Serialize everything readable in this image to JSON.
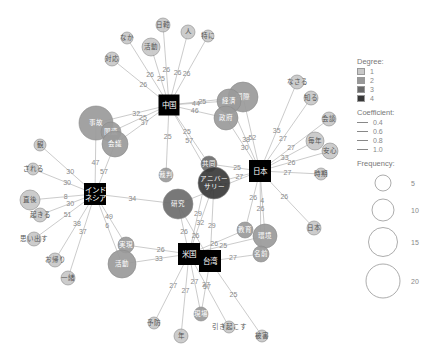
{
  "legend": {
    "degree_title": "Degree:",
    "degree_items": [
      {
        "label": "1",
        "color": "#c8c8c8"
      },
      {
        "label": "2",
        "color": "#999999"
      },
      {
        "label": "3",
        "color": "#6a6a6a"
      },
      {
        "label": "4",
        "color": "#383838"
      }
    ],
    "coefficient_title": "Coefficient:",
    "coefficient_items": [
      {
        "label": "0.4",
        "width": 0.5
      },
      {
        "label": "0.6",
        "width": 0.9
      },
      {
        "label": "0.8",
        "width": 1.3
      },
      {
        "label": "1.0",
        "width": 1.7
      }
    ],
    "frequency_title": "Frequency:",
    "frequency_items": [
      {
        "label": "5",
        "r": 12
      },
      {
        "label": "10",
        "r": 17
      },
      {
        "label": "15",
        "r": 22
      },
      {
        "label": "20",
        "r": 25
      }
    ]
  },
  "hubs": [
    {
      "id": "china",
      "label": "中国",
      "x": 169,
      "y": 105,
      "w": 21,
      "h": 21
    },
    {
      "id": "japan",
      "label": "日本",
      "x": 260,
      "y": 171,
      "w": 22,
      "h": 22
    },
    {
      "id": "indonesia",
      "label": "インド\nネシア",
      "x": 95,
      "y": 194,
      "w": 22,
      "h": 22
    },
    {
      "id": "usa",
      "label": "米国",
      "x": 189,
      "y": 254,
      "w": 22,
      "h": 22
    },
    {
      "id": "taiwan",
      "label": "台湾",
      "x": 210,
      "y": 261,
      "w": 22,
      "h": 22
    }
  ],
  "nodes": [
    {
      "id": "n_nichibei",
      "label": "日韓",
      "x": 163,
      "y": 25,
      "r": 7,
      "degree": 1
    },
    {
      "id": "n_jin",
      "label": "人",
      "x": 188,
      "y": 32,
      "r": 7,
      "degree": 1
    },
    {
      "id": "n_tokai",
      "label": "特に",
      "x": 208,
      "y": 36,
      "r": 6,
      "degree": 1
    },
    {
      "id": "n_nakaha",
      "label": "なか",
      "x": 127,
      "y": 38,
      "r": 6,
      "degree": 1
    },
    {
      "id": "n_katsudo",
      "label": "活動",
      "x": 151,
      "y": 47,
      "r": 9,
      "degree": 1
    },
    {
      "id": "n_taio",
      "label": "対応",
      "x": 112,
      "y": 59,
      "r": 7,
      "degree": 1
    },
    {
      "id": "n_kokusai",
      "label": "国際",
      "x": 243,
      "y": 97,
      "r": 15,
      "degree": 2
    },
    {
      "id": "n_keizai",
      "label": "経済",
      "x": 229,
      "y": 101,
      "r": 12,
      "degree": 2
    },
    {
      "id": "n_seifu",
      "label": "政府",
      "x": 226,
      "y": 118,
      "r": 12,
      "degree": 2
    },
    {
      "id": "n_jiko",
      "label": "事故",
      "x": 96,
      "y": 123,
      "r": 17,
      "degree": 2
    },
    {
      "id": "n_kanren",
      "label": "関連",
      "x": 111,
      "y": 132,
      "r": 10,
      "degree": 2
    },
    {
      "id": "n_kaigi",
      "label": "会議",
      "x": 115,
      "y": 144,
      "r": 13,
      "degree": 2
    },
    {
      "id": "n_saiban",
      "label": "裁判",
      "x": 166,
      "y": 175,
      "r": 7,
      "degree": 2
    },
    {
      "id": "n_kyoudo",
      "label": "共同",
      "x": 209,
      "y": 164,
      "r": 8,
      "degree": 3
    },
    {
      "id": "n_anniv",
      "label": "アニバー\nサリー",
      "x": 214,
      "y": 183,
      "r": 16,
      "degree": 4
    },
    {
      "id": "n_kenkyu",
      "label": "研究",
      "x": 178,
      "y": 204,
      "r": 15,
      "degree": 3
    },
    {
      "id": "n_nakasu",
      "label": "なさる",
      "x": 297,
      "y": 82,
      "r": 7,
      "degree": 1
    },
    {
      "id": "n_chishiki",
      "label": "知る",
      "x": 311,
      "y": 98,
      "r": 7,
      "degree": 1
    },
    {
      "id": "n_kaiken",
      "label": "会談",
      "x": 329,
      "y": 119,
      "r": 7,
      "degree": 1
    },
    {
      "id": "n_mainen",
      "label": "毎年",
      "x": 315,
      "y": 141,
      "r": 9,
      "degree": 1
    },
    {
      "id": "n_anzen",
      "label": "安心",
      "x": 330,
      "y": 151,
      "r": 8,
      "degree": 1
    },
    {
      "id": "n_jikan",
      "label": "時期",
      "x": 321,
      "y": 174,
      "r": 6,
      "degree": 1
    },
    {
      "id": "n_nihon",
      "label": "日本",
      "x": 314,
      "y": 228,
      "r": 7,
      "degree": 1
    },
    {
      "id": "n_kyoiku",
      "label": "教育",
      "x": 245,
      "y": 230,
      "r": 8,
      "degree": 2
    },
    {
      "id": "n_kankyo",
      "label": "環境",
      "x": 265,
      "y": 236,
      "r": 12,
      "degree": 2
    },
    {
      "id": "n_kokoro",
      "label": "名前",
      "x": 261,
      "y": 254,
      "r": 8,
      "degree": 2
    },
    {
      "id": "n_ryo",
      "label": "観",
      "x": 40,
      "y": 145,
      "r": 6,
      "degree": 1
    },
    {
      "id": "n_sareru",
      "label": "される",
      "x": 33,
      "y": 169,
      "r": 6,
      "degree": 1
    },
    {
      "id": "n_ima",
      "label": "直後",
      "x": 30,
      "y": 200,
      "r": 10,
      "degree": 1
    },
    {
      "id": "n_okiru",
      "label": "起きる",
      "x": 40,
      "y": 215,
      "r": 7,
      "degree": 1
    },
    {
      "id": "n_omoidasu",
      "label": "思い出す",
      "x": 34,
      "y": 239,
      "r": 7,
      "degree": 1
    },
    {
      "id": "n_okaeri",
      "label": "お帰り",
      "x": 55,
      "y": 260,
      "r": 7,
      "degree": 1
    },
    {
      "id": "n_ichiban",
      "label": "一緒",
      "x": 68,
      "y": 278,
      "r": 7,
      "degree": 1
    },
    {
      "id": "n_oyaji",
      "label": "実現",
      "x": 126,
      "y": 245,
      "r": 8,
      "degree": 2
    },
    {
      "id": "n_kazoku",
      "label": "活動",
      "x": 122,
      "y": 264,
      "r": 14,
      "degree": 2
    },
    {
      "id": "n_yobou",
      "label": "予防",
      "x": 154,
      "y": 323,
      "r": 6,
      "degree": 1
    },
    {
      "id": "n_nen",
      "label": "年",
      "x": 181,
      "y": 336,
      "r": 7,
      "degree": 1
    },
    {
      "id": "n_genba",
      "label": "現場",
      "x": 201,
      "y": 314,
      "r": 7,
      "degree": 2
    },
    {
      "id": "n_hikiokosu",
      "label": "引き起こす",
      "x": 229,
      "y": 327,
      "r": 6,
      "degree": 1
    },
    {
      "id": "n_higai",
      "label": "被害",
      "x": 262,
      "y": 336,
      "r": 6,
      "degree": 1
    }
  ],
  "edges": [
    {
      "from": "china",
      "to": "n_nichibei",
      "label": "26"
    },
    {
      "from": "china",
      "to": "n_jin",
      "label": "26"
    },
    {
      "from": "china",
      "to": "n_tokai",
      "label": "26"
    },
    {
      "from": "china",
      "to": "n_nakaha",
      "label": "26"
    },
    {
      "from": "china",
      "to": "n_katsudo",
      "label": "25"
    },
    {
      "from": "china",
      "to": "n_taio",
      "label": "26"
    },
    {
      "from": "china",
      "to": "n_keizai",
      "label": "44"
    },
    {
      "from": "china",
      "to": "n_kokusai",
      "label": "25"
    },
    {
      "from": "china",
      "to": "n_seifu",
      "label": "46"
    },
    {
      "from": "china",
      "to": "n_jiko",
      "label": "32"
    },
    {
      "from": "china",
      "to": "n_kanren",
      "label": "25"
    },
    {
      "from": "china",
      "to": "n_kaigi",
      "label": "37"
    },
    {
      "from": "china",
      "to": "n_saiban",
      "label": "25"
    },
    {
      "from": "china",
      "to": "n_kyoudo",
      "label": "25"
    },
    {
      "from": "china",
      "to": "n_anniv",
      "label": "57"
    },
    {
      "from": "japan",
      "to": "n_kokusai",
      "label": "52"
    },
    {
      "from": "japan",
      "to": "n_seifu",
      "label": "30"
    },
    {
      "from": "japan",
      "to": "n_keizai",
      "label": "38"
    },
    {
      "from": "japan",
      "to": "n_nakasu",
      "label": "35"
    },
    {
      "from": "japan",
      "to": "n_chishiki",
      "label": "27"
    },
    {
      "from": "japan",
      "to": "n_kaiken",
      "label": "27"
    },
    {
      "from": "japan",
      "to": "n_mainen",
      "label": "33"
    },
    {
      "from": "japan",
      "to": "n_anzen",
      "label": "26"
    },
    {
      "from": "japan",
      "to": "n_jikan",
      "label": "27"
    },
    {
      "from": "japan",
      "to": "n_nihon",
      "label": "26"
    },
    {
      "from": "japan",
      "to": "n_kyoudo",
      "label": "25"
    },
    {
      "from": "japan",
      "to": "n_anniv",
      "label": "27"
    },
    {
      "from": "japan",
      "to": "n_kenkyu",
      "label": "57"
    },
    {
      "from": "japan",
      "to": "n_kyoiku",
      "label": "26"
    },
    {
      "from": "japan",
      "to": "n_kankyo",
      "label": "4"
    },
    {
      "from": "japan",
      "to": "n_kokoro",
      "label": "26"
    },
    {
      "from": "indonesia",
      "to": "n_jiko",
      "label": "47"
    },
    {
      "from": "indonesia",
      "to": "n_kaigi",
      "label": "57"
    },
    {
      "from": "indonesia",
      "to": "n_ryo",
      "label": "30"
    },
    {
      "from": "indonesia",
      "to": "n_sareru",
      "label": "30"
    },
    {
      "from": "indonesia",
      "to": "n_ima",
      "label": "8"
    },
    {
      "from": "indonesia",
      "to": "n_okiru",
      "label": "30"
    },
    {
      "from": "indonesia",
      "to": "n_omoidasu",
      "label": "51"
    },
    {
      "from": "indonesia",
      "to": "n_okaeri",
      "label": "38"
    },
    {
      "from": "indonesia",
      "to": "n_ichiban",
      "label": "37"
    },
    {
      "from": "indonesia",
      "to": "n_kenkyu",
      "label": "34"
    },
    {
      "from": "indonesia",
      "to": "n_oyaji",
      "label": "49"
    },
    {
      "from": "indonesia",
      "to": "n_kazoku",
      "label": "6"
    },
    {
      "from": "usa",
      "to": "n_kenkyu",
      "label": "26"
    },
    {
      "from": "usa",
      "to": "n_anniv",
      "label": "32"
    },
    {
      "from": "usa",
      "to": "n_kyoudo",
      "label": "29"
    },
    {
      "from": "usa",
      "to": "n_oyaji",
      "label": "26"
    },
    {
      "from": "usa",
      "to": "n_kazoku",
      "label": "33"
    },
    {
      "from": "usa",
      "to": "n_kyoiku",
      "label": "26"
    },
    {
      "from": "usa",
      "to": "n_kankyo",
      "label": "25"
    },
    {
      "from": "usa",
      "to": "n_yobou",
      "label": "27"
    },
    {
      "from": "usa",
      "to": "n_nen",
      "label": "27"
    },
    {
      "from": "usa",
      "to": "n_genba",
      "label": "27"
    },
    {
      "from": "usa",
      "to": "n_hikiokosu",
      "label": "57"
    },
    {
      "from": "taiwan",
      "to": "n_kenkyu",
      "label": "26"
    },
    {
      "from": "taiwan",
      "to": "n_anniv",
      "label": "29"
    },
    {
      "from": "taiwan",
      "to": "n_kokoro",
      "label": "27"
    },
    {
      "from": "taiwan",
      "to": "n_genba",
      "label": "27"
    },
    {
      "from": "taiwan",
      "to": "n_higai",
      "label": "25"
    }
  ]
}
